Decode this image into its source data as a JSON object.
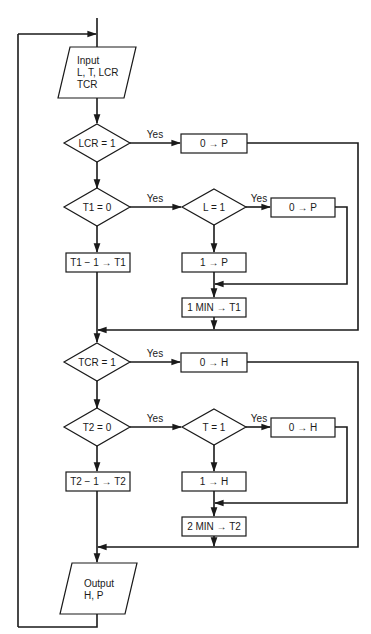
{
  "diagram": {
    "type": "flowchart",
    "input": {
      "line1": "Input",
      "line2": "L, T, LCR",
      "line3": "TCR"
    },
    "output": {
      "line1": "Output",
      "line2": "H, P"
    },
    "decisions": {
      "lcr": "LCR = 1",
      "t1": "T1 = 0",
      "l": "L = 1",
      "tcr": "TCR = 1",
      "t2": "T2 = 0",
      "t": "T = 1"
    },
    "processes": {
      "lcr_yes": "0 → P",
      "l_yes": "0 → P",
      "t1_dec": "T1 − 1 → T1",
      "l_no": "1 → P",
      "t1_set": "1 MIN → T1",
      "tcr_yes": "0 → H",
      "t_yes": "0 → H",
      "t2_dec": "T2 − 1 → T2",
      "t_no": "1 → H",
      "t2_set": "2 MIN → T2"
    },
    "edge_labels": {
      "yes": "Yes"
    }
  }
}
